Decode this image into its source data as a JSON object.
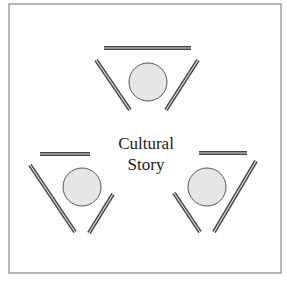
{
  "diagram": {
    "center_label": {
      "line1": "Cultural",
      "line2": "Story"
    },
    "frame": {
      "x": 9,
      "y": 4,
      "width": 272,
      "height": 269,
      "stroke": "#888888"
    },
    "circle_fill": "#e6e6e6",
    "circle_stroke": "#555555",
    "bar_color": "#444444",
    "groups": [
      {
        "name": "top",
        "circle": {
          "cx": 148,
          "cy": 82,
          "r": 19
        },
        "bars": [
          {
            "x1": 104,
            "y1": 48,
            "x2": 191,
            "y2": 48
          },
          {
            "x1": 96,
            "y1": 60,
            "x2": 130,
            "y2": 110
          },
          {
            "x1": 198,
            "y1": 60,
            "x2": 166,
            "y2": 110
          }
        ]
      },
      {
        "name": "bottom-left",
        "circle": {
          "cx": 82,
          "cy": 187,
          "r": 19
        },
        "bars": [
          {
            "x1": 40,
            "y1": 154,
            "x2": 90,
            "y2": 154
          },
          {
            "x1": 30,
            "y1": 165,
            "x2": 75,
            "y2": 232
          },
          {
            "x1": 113,
            "y1": 194,
            "x2": 89,
            "y2": 233
          }
        ]
      },
      {
        "name": "bottom-right",
        "circle": {
          "cx": 207,
          "cy": 187,
          "r": 19
        },
        "bars": [
          {
            "x1": 199,
            "y1": 153,
            "x2": 247,
            "y2": 153
          },
          {
            "x1": 174,
            "y1": 193,
            "x2": 200,
            "y2": 232
          },
          {
            "x1": 256,
            "y1": 161,
            "x2": 214,
            "y2": 232
          }
        ]
      }
    ]
  }
}
